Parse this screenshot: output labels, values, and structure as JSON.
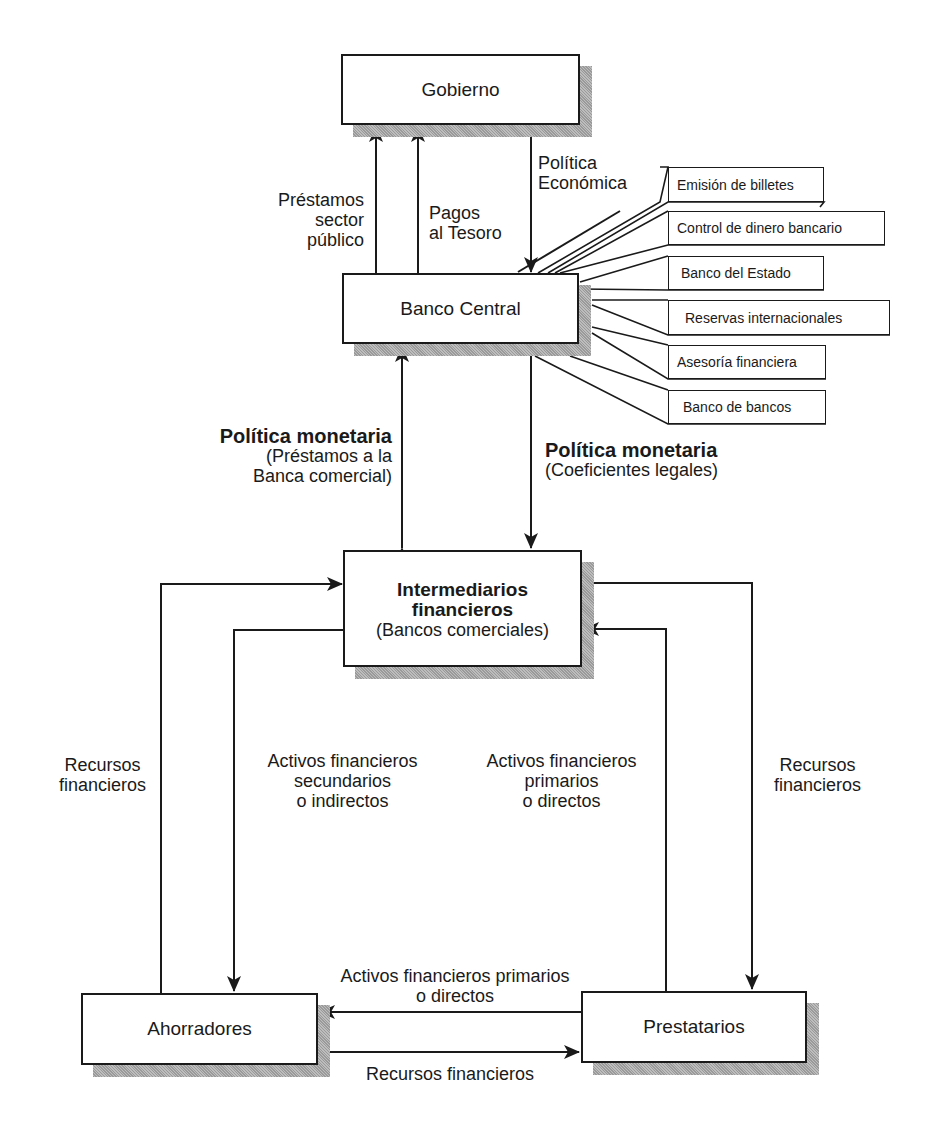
{
  "nodes": {
    "gobierno": "Gobierno",
    "banco_central": "Banco Central",
    "intermediarios_title_1": "Intermediarios",
    "intermediarios_title_2": "financieros",
    "intermediarios_sub": "(Bancos comerciales)",
    "ahorradores": "Ahorradores",
    "prestatarios": "Prestatarios"
  },
  "central_bank_functions": [
    "Emisión de billetes",
    "Control de dinero bancario",
    "Banco del Estado",
    "Reservas internacionales",
    "Asesoría financiera",
    "Banco de bancos"
  ],
  "edges": {
    "prestamos_sector_publico": [
      "Préstamos",
      "sector",
      "público"
    ],
    "pagos_tesoro": [
      "Pagos",
      "al Tesoro"
    ],
    "politica_economica": [
      "Política",
      "Económica"
    ],
    "politica_monetaria_left": {
      "title": "Política monetaria",
      "lines": [
        "(Préstamos a la",
        "Banca comercial)"
      ]
    },
    "politica_monetaria_right": {
      "title": "Política monetaria",
      "lines": [
        "(Coeficientes legales)"
      ]
    },
    "recursos_left": [
      "Recursos",
      "financieros"
    ],
    "activos_secundarios": [
      "Activos financieros",
      "secundarios",
      "o indirectos"
    ],
    "activos_primarios_vertical": [
      "Activos financieros",
      "primarios",
      "o directos"
    ],
    "recursos_right": [
      "Recursos",
      "financieros"
    ],
    "activos_primarios_bottom": [
      "Activos financieros primarios",
      "o directos"
    ],
    "recursos_bottom": "Recursos financieros"
  }
}
